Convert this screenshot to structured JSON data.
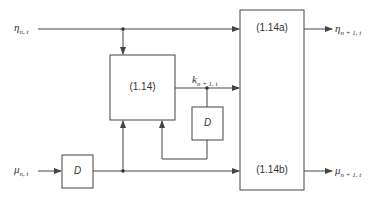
{
  "diagram": {
    "inputs": {
      "eta": {
        "symbol": "η",
        "subscript": "n, t"
      },
      "mu": {
        "symbol": "μ",
        "subscript": "n, t"
      }
    },
    "outputs": {
      "eta": {
        "symbol": "η",
        "subscript": "n + 1, t"
      },
      "mu": {
        "symbol": "μ",
        "subscript": "n + 1, t"
      },
      "k": {
        "symbol": "k",
        "subscript": "n + 1, t"
      }
    },
    "blocks": {
      "main": "(1.14)",
      "out_a": "(1.14a)",
      "out_b": "(1.14b)",
      "delay_1": "D",
      "delay_2": "D"
    },
    "colors": {
      "line": "#444444",
      "background": "#ffffff"
    }
  }
}
